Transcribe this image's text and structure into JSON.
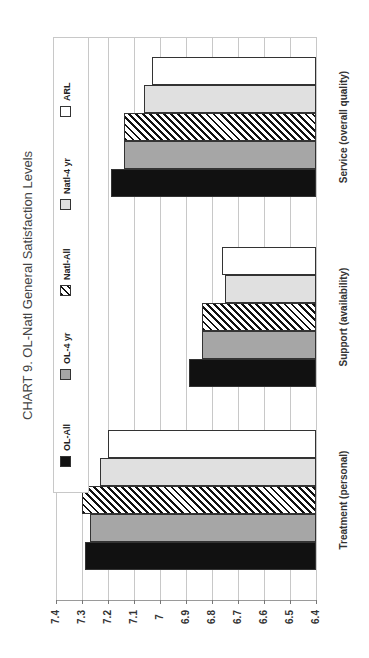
{
  "chart_data": {
    "type": "bar",
    "orientation": "horizontal (page rotated 90°)",
    "title": "CHART 9. OL-Natl General Satisfaction Levels",
    "xlabel": "",
    "ylabel": "",
    "categories": [
      "Treatment (personal)",
      "Support (availability)",
      "Service (overall quality)"
    ],
    "series": [
      {
        "name": "OL-All",
        "values": [
          7.29,
          6.89,
          7.19
        ],
        "color": "#111111",
        "pattern": "solid"
      },
      {
        "name": "OL-4 yr",
        "values": [
          7.27,
          6.84,
          7.14
        ],
        "color": "#a6a6a6",
        "pattern": "solid"
      },
      {
        "name": "Natl-All",
        "values": [
          7.3,
          6.84,
          7.14
        ],
        "color": "#111111",
        "pattern": "diagonal-hatch"
      },
      {
        "name": "Natl-4 yr",
        "values": [
          7.23,
          6.75,
          7.06
        ],
        "color": "#e0e0e0",
        "pattern": "solid"
      },
      {
        "name": "ARL",
        "values": [
          7.2,
          6.76,
          7.03
        ],
        "color": "#ffffff",
        "pattern": "solid"
      }
    ],
    "value_axis": {
      "range": [
        6.4,
        7.4
      ],
      "ticks": [
        "7.4",
        "7.3",
        "7.2",
        "7.1",
        "7",
        "6.9",
        "6.8",
        "6.7",
        "6.6",
        "6.5",
        "6.4"
      ]
    },
    "grid": true,
    "legend_position": "top (left side of rotated page)"
  },
  "title": "CHART 9. OL-Natl General Satisfaction Levels",
  "legend": [
    "OL-All",
    "OL-4 yr",
    "Natl-All",
    "Natl-4 yr",
    "ARL"
  ],
  "categories": [
    "Treatment (personal)",
    "Support (availability)",
    "Service (overall quality)"
  ],
  "ticks": [
    "7.4",
    "7.3",
    "7.2",
    "7.1",
    "7",
    "6.9",
    "6.8",
    "6.7",
    "6.6",
    "6.5",
    "6.4"
  ]
}
